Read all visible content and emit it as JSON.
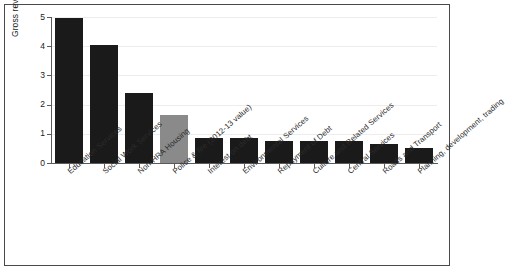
{
  "chart_data": {
    "type": "bar",
    "title": "",
    "subtitle": "",
    "xlabel": "",
    "ylabel": "Gross revenue expenditure / £ billion",
    "ylim": [
      0,
      5
    ],
    "ytick_labels": [
      "0",
      "1",
      "2",
      "3",
      "4",
      "5"
    ],
    "ytick_values": [
      0,
      1,
      2,
      3,
      4,
      5
    ],
    "grid": "horizontal",
    "legend": "none",
    "bar_colors": {
      "default": "#1a1a1a",
      "highlight": "#8a8a8a"
    },
    "categories": [
      "Education Services",
      "Social Work Services",
      "Non-HRA Housing",
      "Police & fire (2012-13 value)",
      "Interest on debt",
      "Environmental Services",
      "Repayment of Debt",
      "Culture and Related Services",
      "Central Services",
      "Roads and Transport",
      "Planning, development, trading"
    ],
    "values": [
      4.95,
      4.05,
      2.4,
      1.65,
      0.85,
      0.85,
      0.75,
      0.75,
      0.75,
      0.65,
      0.5
    ],
    "point_colors": [
      "#1a1a1a",
      "#1a1a1a",
      "#1a1a1a",
      "#8a8a8a",
      "#1a1a1a",
      "#1a1a1a",
      "#1a1a1a",
      "#1a1a1a",
      "#1a1a1a",
      "#1a1a1a",
      "#1a1a1a"
    ]
  }
}
